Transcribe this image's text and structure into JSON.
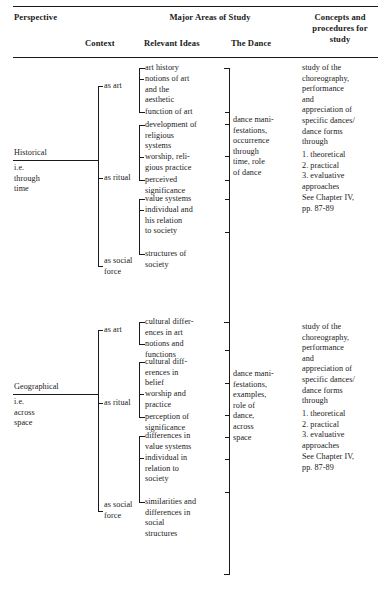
{
  "table": {
    "header": {
      "perspective": "Perspective",
      "major_areas": "Major Areas of Study",
      "context": "Context",
      "relevant_ideas": "Relevant Ideas",
      "the_dance": "The Dance",
      "concepts": "Concepts and\nprocedures for\nstudy"
    },
    "rows": [
      {
        "perspective_name": "Historical",
        "perspective_sub": "i.e.\nthrough\ntime",
        "contexts": [
          {
            "label": "as art",
            "ideas": [
              "art history",
              "notions of art\nand the\naesthetic",
              "function of art"
            ]
          },
          {
            "label": "as ritual",
            "ideas": [
              "development of\nreligious\nsystems",
              "worship, reli-\ngious practice",
              "perceived\nsignificance"
            ]
          },
          {
            "label": "as social\nforce",
            "ideas": [
              "value systems",
              "individual and\nhis relation\nto society",
              "structures of\nsociety"
            ]
          }
        ],
        "the_dance": "dance mani-\nfestations,\noccurrence\nthrough\ntime, role\nof dance",
        "concepts": "study of the\nchoreography,\nperformance\nand\nappreciation of\nspecific dances/\ndance forms\nthrough",
        "concepts_list": "1. theoretical\n2. practical\n3. evaluative\n    approaches",
        "concepts_ref": "See Chapter IV,\npp. 87-89"
      },
      {
        "perspective_name": "Geographical",
        "perspective_sub": "i.e.\nacross\nspace",
        "contexts": [
          {
            "label": "as art",
            "ideas": [
              "cultural differ-\nences in art",
              "notions and\nfunctions"
            ]
          },
          {
            "label": "as ritual",
            "ideas": [
              "cultural diff-\nerences in\nbelief",
              "worship and\npractice",
              "perception of\nsignificance"
            ]
          },
          {
            "label": "as social\nforce",
            "ideas": [
              "differences in\nvalue systems",
              "individual in\nrelation to\nsociety",
              "similarities and\ndifferences in\nsocial\nstructures"
            ]
          }
        ],
        "the_dance": "dance mani-\nfestations,\nexamples,\nrole of\ndance,\nacross\nspace",
        "concepts": "study of the\nchoreography,\nperformance\nand\nappreciation of\nspecific dances/\ndance forms\nthrough",
        "concepts_list": "1. theoretical\n2. practical\n3. evaluative\n    approaches",
        "concepts_ref": "See Chapter IV,\npp. 87-89"
      }
    ]
  },
  "colors": {
    "ink": "#1a1a1a",
    "page": "#ffffff"
  }
}
